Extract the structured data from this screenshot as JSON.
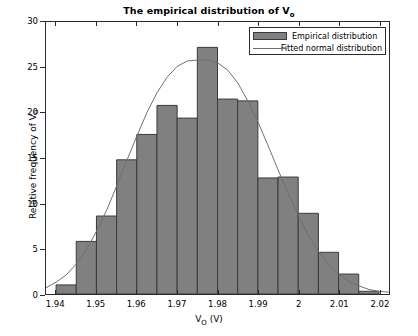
{
  "chart_data": {
    "type": "bar",
    "title_main": "The empirical distribution of V",
    "title_sub": "o",
    "xlabel_main": "V",
    "xlabel_sub": "O",
    "xlabel_tail": " (V)",
    "xlabel": "V_O (V)",
    "ylabel_main": "Relative frequency of V",
    "ylabel_sub": "o",
    "ylabel": "Relative frequency of V_o",
    "xlim": [
      1.9375,
      2.0225
    ],
    "ylim": [
      0,
      30
    ],
    "grid": false,
    "legend_position": "top-right",
    "bin_width": 0.005,
    "bin_edges": [
      1.94,
      1.945,
      1.95,
      1.955,
      1.96,
      1.965,
      1.97,
      1.975,
      1.98,
      1.985,
      1.99,
      1.995,
      2.0,
      2.005,
      2.01,
      2.015,
      2.02
    ],
    "categories": [
      "1.9425",
      "1.9475",
      "1.9525",
      "1.9575",
      "1.9625",
      "1.9675",
      "1.9725",
      "1.9775",
      "1.9825",
      "1.9875",
      "1.9925",
      "1.9975",
      "2.0025",
      "2.0075",
      "2.0125",
      "2.0175"
    ],
    "values": [
      1.0,
      5.8,
      8.6,
      14.8,
      17.6,
      20.8,
      19.4,
      27.2,
      21.5,
      21.3,
      12.8,
      12.9,
      8.9,
      4.6,
      2.2,
      0.3
    ],
    "series": [
      {
        "name": "Empirical distribution",
        "type": "bar",
        "color": "#808080",
        "edge_color": "#3a3a3a",
        "values": [
          1.0,
          5.8,
          8.6,
          14.8,
          17.6,
          20.8,
          19.4,
          27.2,
          21.5,
          21.3,
          12.8,
          12.9,
          8.9,
          4.6,
          2.2,
          0.3
        ]
      },
      {
        "name": "Fitted normal distribution",
        "type": "line",
        "color": "#707070",
        "fit_mean": 1.9775,
        "fit_sigma": 0.01295,
        "fit_peak": 25.8,
        "x": [
          1.9375,
          1.94,
          1.9425,
          1.945,
          1.9475,
          1.95,
          1.9525,
          1.955,
          1.9575,
          1.96,
          1.9625,
          1.965,
          1.9675,
          1.97,
          1.9725,
          1.975,
          1.9775,
          1.98,
          1.9825,
          1.985,
          1.9875,
          1.99,
          1.9925,
          1.995,
          1.9975,
          2.0,
          2.0025,
          2.005,
          2.0075,
          2.01,
          2.0125,
          2.015,
          2.0175,
          2.02,
          2.0225
        ],
        "y": [
          0.7,
          1.3,
          2.1,
          3.3,
          4.9,
          6.9,
          9.2,
          11.9,
          14.7,
          17.4,
          20.0,
          22.2,
          23.9,
          25.1,
          25.7,
          25.8,
          25.8,
          25.5,
          24.7,
          23.3,
          21.3,
          19.0,
          16.4,
          13.7,
          11.1,
          8.7,
          6.5,
          4.7,
          3.3,
          2.2,
          1.4,
          0.9,
          0.5,
          0.3,
          0.2
        ]
      }
    ],
    "xticks": [
      1.94,
      1.95,
      1.96,
      1.97,
      1.98,
      1.99,
      2.0,
      2.01,
      2.02
    ],
    "xtick_labels": [
      "1.94",
      "1.95",
      "1.96",
      "1.97",
      "1.98",
      "1.99",
      "2",
      "2.01",
      "2.02"
    ],
    "yticks": [
      0,
      5,
      10,
      15,
      20,
      25,
      30
    ],
    "ytick_labels": [
      "0",
      "5",
      "10",
      "15",
      "20",
      "25",
      "30"
    ]
  },
  "legend": {
    "entries": [
      {
        "label": "Empirical distribution",
        "swatch": "bar-swatch"
      },
      {
        "label": "Fitted normal distribution",
        "swatch": "line-swatch"
      }
    ]
  },
  "colors": {
    "bar_fill": "#808080",
    "bar_edge": "#3a3a3a",
    "curve": "#707070",
    "axis": "#2b2b2b",
    "background": "#ffffff"
  }
}
